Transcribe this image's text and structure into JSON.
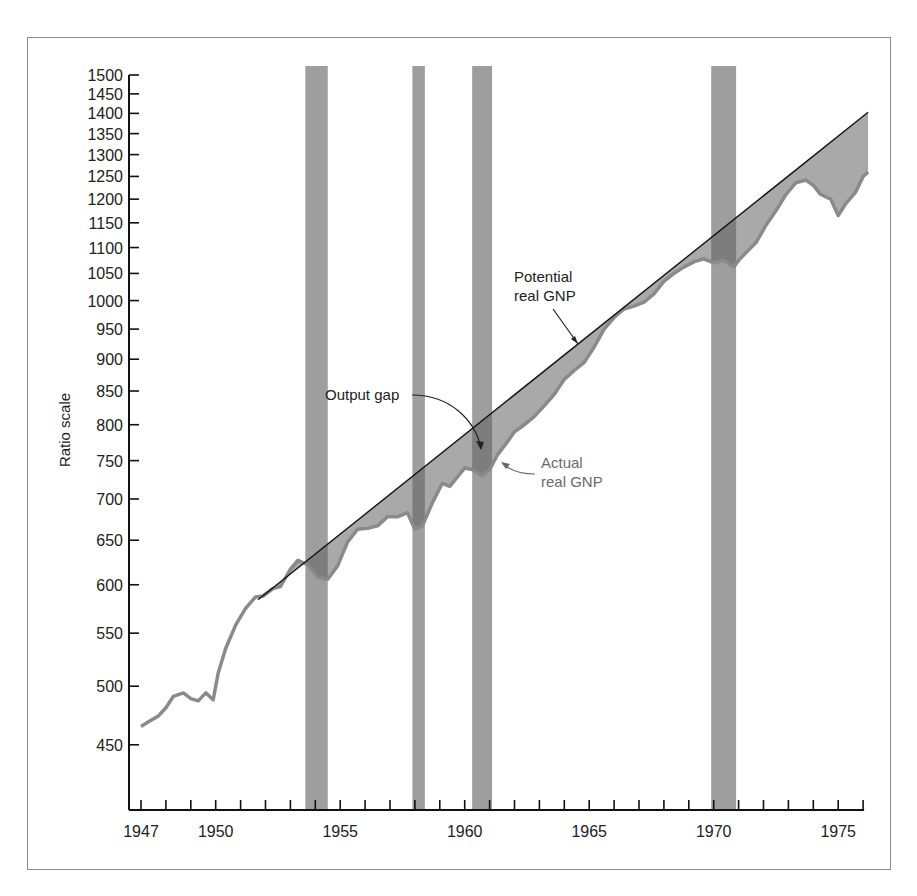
{
  "chart_data": {
    "type": "line",
    "title": "",
    "xlabel": "",
    "ylabel": "Ratio scale",
    "y_scale": "log",
    "ylim": [
      400,
      1500
    ],
    "xlim": [
      1946.5,
      1976.3
    ],
    "y_ticks": [
      1500,
      1450,
      1400,
      1350,
      1300,
      1250,
      1200,
      1150,
      1100,
      1050,
      1000,
      950,
      900,
      850,
      800,
      750,
      700,
      650,
      600,
      550,
      500,
      450
    ],
    "x_tick_labels": [
      {
        "year": 1947,
        "label": "1947"
      },
      {
        "year": 1950,
        "label": "1950"
      },
      {
        "year": 1955,
        "label": "1955"
      },
      {
        "year": 1960,
        "label": "1960"
      },
      {
        "year": 1965,
        "label": "1965"
      },
      {
        "year": 1970,
        "label": "1970"
      },
      {
        "year": 1975,
        "label": "1975"
      }
    ],
    "x_minor_ticks_from": 1947,
    "x_minor_ticks_to": 1976,
    "grid": false,
    "recessions": [
      {
        "start": 1953.6,
        "end": 1954.5
      },
      {
        "start": 1957.9,
        "end": 1958.4
      },
      {
        "start": 1960.3,
        "end": 1961.1
      },
      {
        "start": 1969.9,
        "end": 1970.9
      }
    ],
    "series": [
      {
        "name": "Potential real GNP",
        "style": "line",
        "x": [
          1951.7,
          1976.2
        ],
        "values": [
          584,
          1403
        ]
      },
      {
        "name": "Actual real GNP",
        "style": "line",
        "x": [
          1947.0,
          1947.3,
          1947.7,
          1948.0,
          1948.3,
          1948.7,
          1949.0,
          1949.3,
          1949.6,
          1949.9,
          1950.1,
          1950.4,
          1950.8,
          1951.2,
          1951.6,
          1951.9,
          1952.3,
          1952.6,
          1953.0,
          1953.3,
          1953.7,
          1954.1,
          1954.5,
          1954.9,
          1955.3,
          1955.7,
          1956.1,
          1956.5,
          1956.9,
          1957.3,
          1957.7,
          1958.0,
          1958.3,
          1958.7,
          1959.1,
          1959.4,
          1959.7,
          1960.0,
          1960.3,
          1960.7,
          1961.0,
          1961.3,
          1961.7,
          1962.0,
          1962.4,
          1962.8,
          1963.2,
          1963.6,
          1964.0,
          1964.4,
          1964.8,
          1965.2,
          1965.6,
          1966.0,
          1966.4,
          1966.8,
          1967.2,
          1967.6,
          1968.0,
          1968.4,
          1968.8,
          1969.2,
          1969.6,
          1970.0,
          1970.4,
          1970.8,
          1971.0,
          1971.3,
          1971.7,
          1972.1,
          1972.5,
          1972.9,
          1973.3,
          1973.7,
          1974.0,
          1974.3,
          1974.7,
          1975.0,
          1975.3,
          1975.7,
          1976.0,
          1976.2
        ],
        "values": [
          465,
          469,
          474,
          481,
          491,
          494,
          489,
          487,
          494,
          488,
          512,
          535,
          558,
          575,
          587,
          588,
          596,
          598,
          617,
          627,
          622,
          608,
          606,
          621,
          648,
          663,
          664,
          667,
          678,
          678,
          683,
          663,
          667,
          695,
          720,
          716,
          728,
          740,
          738,
          730,
          738,
          757,
          775,
          790,
          800,
          812,
          828,
          845,
          868,
          882,
          895,
          920,
          950,
          970,
          985,
          990,
          997,
          1012,
          1035,
          1050,
          1062,
          1072,
          1078,
          1070,
          1075,
          1062,
          1075,
          1090,
          1110,
          1145,
          1175,
          1210,
          1236,
          1242,
          1230,
          1210,
          1200,
          1165,
          1190,
          1215,
          1250,
          1260
        ]
      }
    ],
    "annotations": [
      {
        "text_lines": [
          "Potential",
          "real GNP"
        ],
        "points_to": "Potential real GNP"
      },
      {
        "text_lines": [
          "Output gap"
        ],
        "points_to": "shaded area between lines"
      },
      {
        "text_lines": [
          "Actual",
          "real GNP"
        ],
        "points_to": "Actual real GNP"
      }
    ],
    "colors": {
      "recession_bar": "#9e9e9e",
      "actual_line": "#8a8a8a",
      "gap_fill": "#a9a9a9",
      "gap_fill_overlap": "#7d7d7d",
      "potential_line": "#111111",
      "axis": "#111111"
    }
  },
  "labels": {
    "ylabel": "Ratio scale",
    "potential_1": "Potential",
    "potential_2": "real GNP",
    "gap": "Output gap",
    "actual_1": "Actual",
    "actual_2": "real GNP"
  }
}
